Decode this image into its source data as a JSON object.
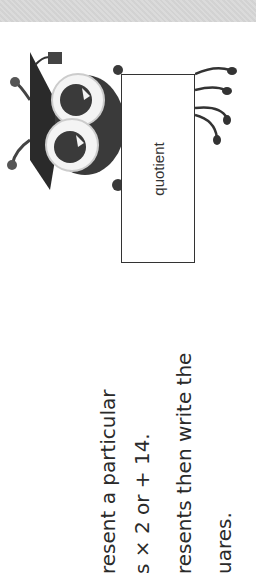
{
  "page": {
    "orientation": "rotated -90deg",
    "background": "#ffffff",
    "top_band_color": "#d9d9d9"
  },
  "illustration": {
    "character": "bug-with-graduation-cap",
    "card_label": "quotient"
  },
  "instructions": {
    "lines": [
      "resent a particular",
      "s × 2 or + 14.",
      "resents then write the",
      "uares."
    ]
  }
}
